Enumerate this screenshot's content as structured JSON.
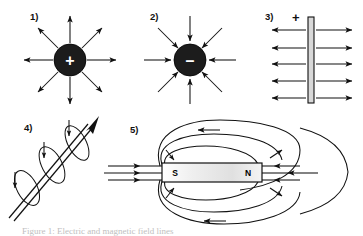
{
  "figure": {
    "kind": "physics-field-line-diagram-sheet",
    "background_color": "#ffffff",
    "ink_color": "#111111",
    "width": 363,
    "height": 236,
    "panels": [
      {
        "id": "panel-1",
        "label": "1)",
        "label_x": 30,
        "label_y": 18,
        "subject": "positive-point-charge",
        "charge_sign": "+",
        "charge_cx": 70,
        "charge_cy": 60,
        "charge_r": 16,
        "charge_fill": "#1c1c1c",
        "field_direction": "outward",
        "ray_count": 8,
        "ray_inner": 17,
        "ray_outer": 46
      },
      {
        "id": "panel-2",
        "label": "2)",
        "label_x": 150,
        "label_y": 18,
        "subject": "negative-point-charge",
        "charge_sign": "–",
        "charge_cx": 190,
        "charge_cy": 60,
        "charge_r": 16,
        "charge_fill": "#1c1c1c",
        "field_direction": "inward",
        "ray_count": 8,
        "ray_inner": 17,
        "ray_outer": 46
      },
      {
        "id": "panel-3",
        "label": "3)",
        "label_x": 267,
        "label_y": 18,
        "subject": "positively-charged-plate",
        "polarity_label": "+",
        "polarity_x": 296,
        "polarity_y": 20,
        "plate_x": 308,
        "plate_y": 17,
        "plate_w": 6,
        "plate_h": 86,
        "plate_fill": "#d8d8d8",
        "field_direction": "outward-both-sides",
        "line_count_per_side": 5,
        "line_ys": [
          30,
          48,
          64,
          81,
          98
        ],
        "left_start": 269,
        "right_end": 355
      },
      {
        "id": "panel-4",
        "label": "4)",
        "label_x": 24,
        "label_y": 129,
        "subject": "current-carrying-wire-with-circular-magnetic-field",
        "wire_from_x": 12,
        "wire_from_y": 214,
        "wire_to_x": 94,
        "wire_to_y": 117,
        "wire_arrow": "up-right",
        "loop_count": 3,
        "loop_centers": [
          [
            28,
            186
          ],
          [
            52,
            165
          ],
          [
            76,
            143
          ]
        ]
      },
      {
        "id": "panel-5",
        "label": "5)",
        "label_x": 130,
        "label_y": 131,
        "subject": "bar-magnet-field-lines",
        "magnet_x": 162,
        "magnet_y": 163,
        "magnet_w": 100,
        "magnet_h": 19,
        "magnet_fill_left": "#ffffff",
        "magnet_fill_right": "#e8e8e8",
        "south_pole_label": "S",
        "south_pole_x": 175,
        "south_pole_y": 176,
        "north_pole_label": "N",
        "north_pole_x": 248,
        "north_pole_y": 176,
        "top_arrow_direction": "left",
        "bottom_arrow_direction": "left",
        "straight_line_count_left": 3,
        "straight_line_count_right": 3
      }
    ],
    "caption": {
      "visible": true,
      "clipped": true,
      "text": "Figure 1: Electric and magnetic field lines"
    }
  }
}
